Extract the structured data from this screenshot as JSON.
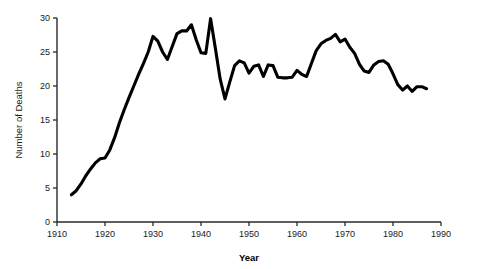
{
  "chart_data": {
    "type": "line",
    "title": "",
    "xlabel": "Year",
    "ylabel": "Number of Deaths",
    "xlim": [
      1910,
      1990
    ],
    "ylim": [
      0,
      30
    ],
    "grid": false,
    "legend": false,
    "xticks": [
      1910,
      1920,
      1930,
      1940,
      1950,
      1960,
      1970,
      1980,
      1990
    ],
    "xtick_labels": [
      "1910",
      "1920",
      "1930",
      "1940",
      "1950",
      "1960",
      "1970",
      "1980",
      "1990"
    ],
    "yticks": [
      0,
      5,
      10,
      15,
      20,
      25,
      30
    ],
    "ytick_labels": [
      "0",
      "5",
      "10",
      "15",
      "20",
      "25",
      "30"
    ],
    "series": [
      {
        "name": "Number of Deaths",
        "color": "#000000",
        "x": [
          1913,
          1914,
          1915,
          1916,
          1917,
          1918,
          1919,
          1920,
          1921,
          1922,
          1923,
          1924,
          1925,
          1926,
          1927,
          1928,
          1929,
          1930,
          1931,
          1932,
          1933,
          1934,
          1935,
          1936,
          1937,
          1938,
          1939,
          1940,
          1941,
          1942,
          1943,
          1944,
          1945,
          1946,
          1947,
          1948,
          1949,
          1950,
          1951,
          1952,
          1953,
          1954,
          1955,
          1956,
          1957,
          1958,
          1959,
          1960,
          1961,
          1962,
          1963,
          1964,
          1965,
          1966,
          1967,
          1968,
          1969,
          1970,
          1971,
          1972,
          1973,
          1974,
          1975,
          1976,
          1977,
          1978,
          1979,
          1980,
          1981,
          1982,
          1983,
          1984,
          1985,
          1986,
          1987
        ],
        "y": [
          4.0,
          4.6,
          5.6,
          6.8,
          7.8,
          8.7,
          9.3,
          9.4,
          10.6,
          12.4,
          14.6,
          16.5,
          18.3,
          20.0,
          21.7,
          23.3,
          25.0,
          27.3,
          26.6,
          25.0,
          23.9,
          25.8,
          27.7,
          28.1,
          28.1,
          29.0,
          26.8,
          24.9,
          24.8,
          29.9,
          25.5,
          21.0,
          18.1,
          20.6,
          23.0,
          23.7,
          23.4,
          21.9,
          22.9,
          23.1,
          21.4,
          23.1,
          23.0,
          21.3,
          21.2,
          21.2,
          21.3,
          22.3,
          21.7,
          21.4,
          23.3,
          25.2,
          26.2,
          26.7,
          27.0,
          27.6,
          26.5,
          26.9,
          25.7,
          24.8,
          23.2,
          22.2,
          22.0,
          23.1,
          23.6,
          23.7,
          23.2,
          21.8,
          20.2,
          19.4,
          20.0,
          19.2,
          19.9,
          19.9,
          19.6
        ]
      }
    ]
  },
  "plot_geometry": {
    "x_origin_px": 57,
    "y_origin_px": 222,
    "px_per_decade": 48.0,
    "px_per_unit_y": 6.8,
    "axis_top_px": 18,
    "axis_right_px": 441
  }
}
